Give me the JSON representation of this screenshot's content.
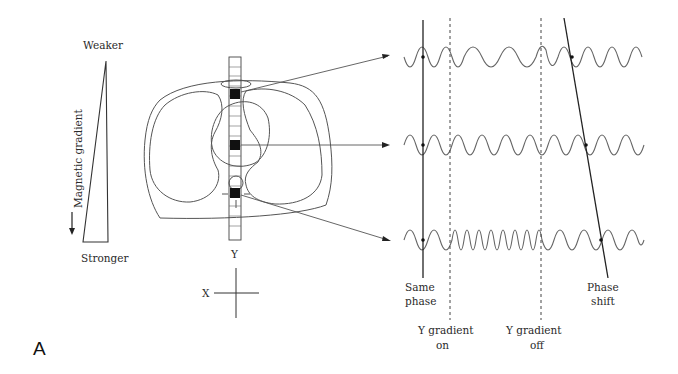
{
  "figure": {
    "panel_label": "A",
    "gradient_scale": {
      "top_label": "Weaker",
      "bottom_label": "Stronger",
      "axis_label": "Magnetic gradient"
    },
    "anatomy": {
      "column_label": "Y",
      "axes": {
        "x_label": "X"
      }
    },
    "waveforms": {
      "rows": [
        {
          "name": "top-voxel",
          "description": "Lower frequency during Y gradient"
        },
        {
          "name": "middle-voxel",
          "description": "Unchanged frequency"
        },
        {
          "name": "bottom-voxel",
          "description": "Higher frequency during Y gradient"
        }
      ],
      "markers": {
        "same_phase": "Same\nphase",
        "same_phase_line1": "Same",
        "same_phase_line2": "phase",
        "gradient_on_line1": "Y gradient",
        "gradient_on_line2": "on",
        "gradient_off_line1": "Y gradient",
        "gradient_off_line2": "off",
        "phase_shift_line1": "Phase",
        "phase_shift_line2": "shift"
      }
    }
  }
}
